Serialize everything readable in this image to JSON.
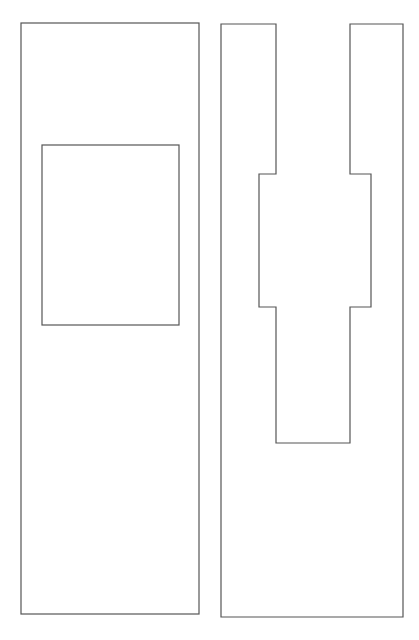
{
  "canvas": {
    "width": 419,
    "height": 640,
    "background": "#ffffff"
  },
  "style": {
    "stroke": "#555555",
    "stroke_width": 1.2
  },
  "left_panel": {
    "outer": {
      "x": 21,
      "y": 23,
      "w": 178,
      "h": 591
    },
    "inner": {
      "x": 42,
      "y": 145,
      "w": 137,
      "h": 180
    }
  },
  "right_panel": {
    "outline_points": "221,24 276,24 276,174 259,174 259,307 276,307 276,443 350,443 350,307 371,307 371,174 350,174 350,24 403,24 403,617 221,617"
  }
}
